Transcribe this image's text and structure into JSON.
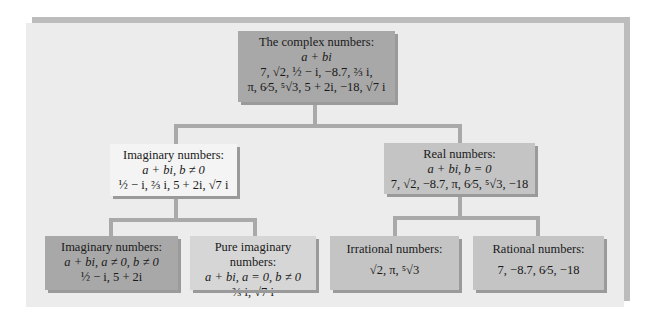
{
  "diagram": {
    "root": {
      "title": "The complex numbers:",
      "form": "a + bi",
      "examples_1": "7, √2, ½ − i, −8.7, ⅔ i,",
      "examples_2": "π, 6⁄5, ⁵√3, 5 + 2i, −18, √7 i"
    },
    "imaginary": {
      "title": "Imaginary numbers:",
      "form": "a + bi, b ≠ 0",
      "examples": "½ − i, ⅔ i, 5 + 2i, √7 i"
    },
    "real": {
      "title": "Real numbers:",
      "form": "a + bi, b = 0",
      "examples": "7, √2, −8.7, π, 6⁄5, ⁵√3, −18"
    },
    "imaginary_nonpure": {
      "title": "Imaginary numbers:",
      "form": "a + bi,  a ≠ 0,  b ≠ 0",
      "examples": "½ − i, 5 + 2i"
    },
    "pure_imaginary": {
      "title": "Pure imaginary numbers:",
      "form": "a + bi,  a = 0,  b ≠ 0",
      "examples": "⅔ i, √7 i"
    },
    "irrational": {
      "title": "Irrational numbers:",
      "examples": "√2,  π,  ⁵√3"
    },
    "rational": {
      "title": "Rational numbers:",
      "examples": "7, −8.7, 6⁄5, −18"
    }
  }
}
